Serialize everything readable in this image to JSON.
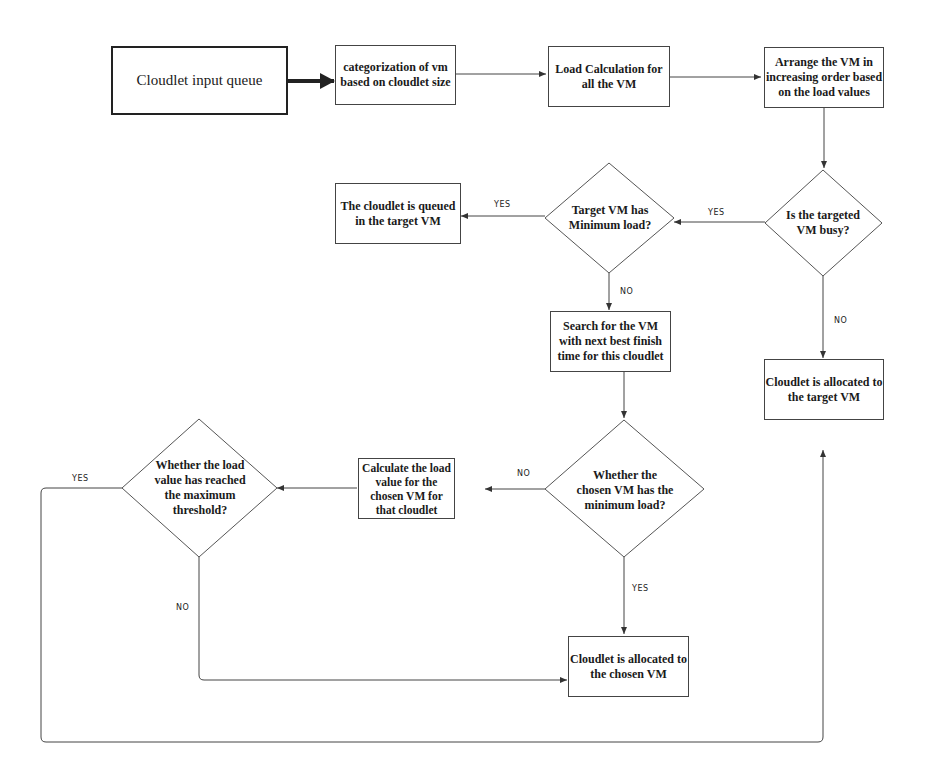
{
  "nodes": {
    "input_queue": "Cloudlet input queue",
    "categorization": "categorization of vm based on cloudlet size",
    "load_calc": "Load Calculation for all the VM",
    "arrange": "Arrange the VM in increasing order based on the load values",
    "vm_busy": "Is the targeted VM busy?",
    "min_load": "Target VM has Minimum load?",
    "queued": "The cloudlet is queued in the target VM",
    "search_next": "Search for the VM with next best finish time for this cloudlet",
    "allocated_target": "Cloudlet is allocated to the target VM",
    "chosen_min_load": "Whether the chosen VM has the minimum load?",
    "calc_chosen": "Calculate the load value for the chosen VM for that cloudlet",
    "threshold": "Whether the load value has reached the maximum threshold?",
    "allocated_chosen": "Cloudlet is allocated to the chosen VM"
  },
  "edge_labels": {
    "busy_yes": "YES",
    "busy_no": "NO",
    "min_yes": "YES",
    "min_no": "NO",
    "chosen_no": "NO",
    "chosen_yes": "YES",
    "threshold_yes": "YES",
    "threshold_no": "NO"
  }
}
